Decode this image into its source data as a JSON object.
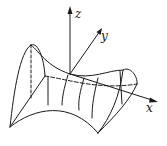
{
  "diagram": {
    "type": "3d-surface",
    "stroke_color": "#1a1a1a",
    "background": "#ffffff",
    "axes": {
      "x": {
        "label": "x"
      },
      "y": {
        "label": "y"
      },
      "z": {
        "label": "z"
      }
    }
  }
}
